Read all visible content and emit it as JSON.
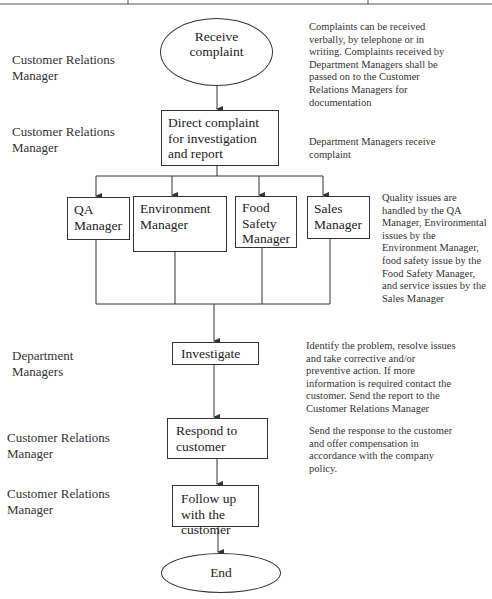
{
  "diagram": {
    "type": "flowchart",
    "roles": [
      {
        "label": "Customer Relations Manager"
      },
      {
        "label": "Customer Relations Manager"
      },
      {
        "label": "Department Managers"
      },
      {
        "label": "Customer Relations Manager"
      },
      {
        "label": "Customer Relations Manager"
      }
    ],
    "steps": {
      "start": "Receive complaint",
      "direct": "Direct complaint for investigation and report",
      "managers": [
        {
          "label": "QA Manager"
        },
        {
          "label": "Environment Manager"
        },
        {
          "label": "Food Safety Manager"
        },
        {
          "label": "Sales Manager"
        }
      ],
      "investigate": "Investigate",
      "respond": "Respond to customer",
      "follow_up": "Follow up with the customer",
      "end": "End"
    },
    "notes": {
      "receive": "Complaints can be received verbally, by telephone or in writing. Complaints received by Department Managers shall be passed on to the Customer Relations Managers for documentation",
      "direct": "Department Managers receive complaint",
      "managers": "Quality issues are handled by the QA Manager, Environmental issues by the Environment Manager, food safety issue by the Food Safety Manager, and service issues by the Sales Manager",
      "investigate": "Identify the problem, resolve issues and take corrective and/or preventive action. If more information is required contact the customer. Send the report to the Customer Relations Manager",
      "respond": "Send the response to the customer and offer compensation in accordance with the company policy."
    },
    "colors": {
      "line": "#333333",
      "text": "#2a2a2a",
      "background": "#ffffff"
    }
  }
}
